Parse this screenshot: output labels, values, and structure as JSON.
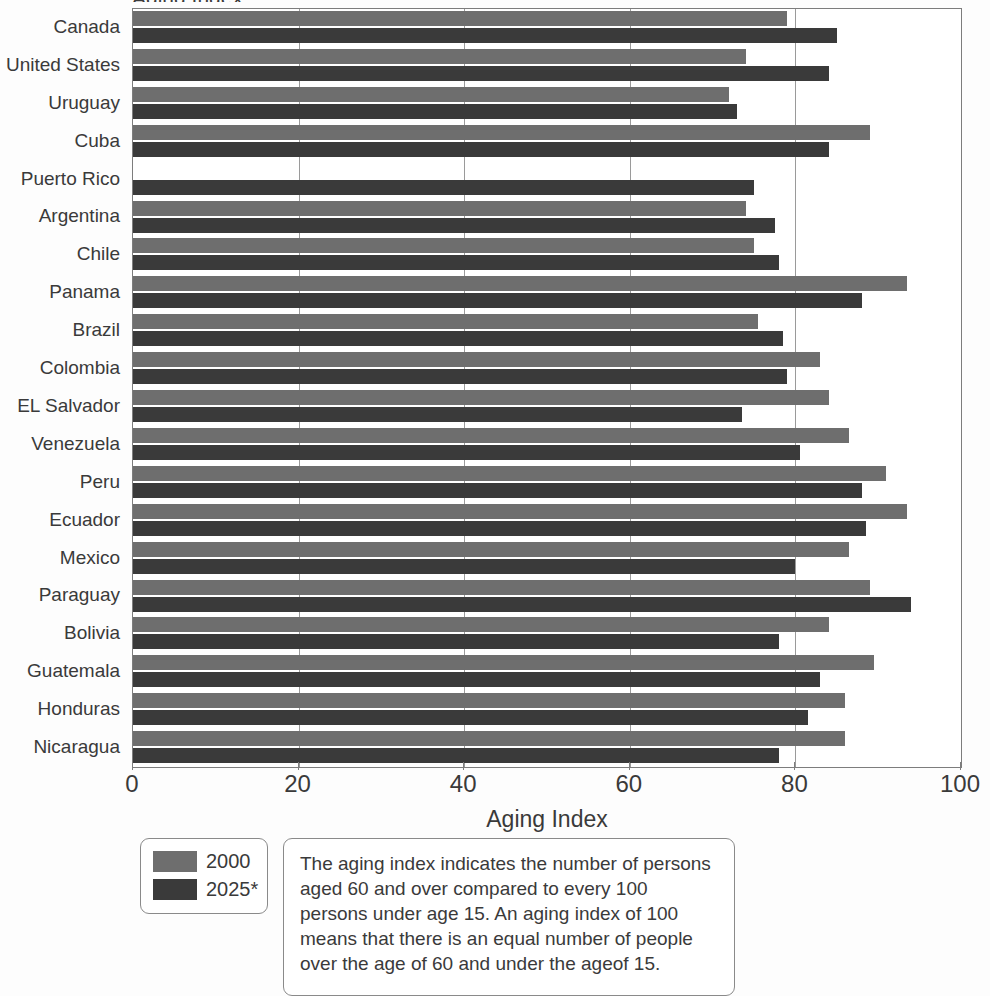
{
  "figure": {
    "cut_off_title": "Aging Index",
    "axis_title": "Aging Index"
  },
  "legend": {
    "position": "below-left",
    "items": [
      {
        "label": "2000",
        "color": "#6e6e6e"
      },
      {
        "label": "2025*",
        "color": "#3a3a3a"
      }
    ]
  },
  "note": {
    "text": "The aging index indicates the number of persons aged 60 and over compared to every 100 persons under age 15. An aging index of 100 means that there is an equal number of people over the age of 60 and under the ageof 15."
  },
  "chart_data": {
    "type": "bar",
    "orientation": "horizontal",
    "title": "Aging Index",
    "xlabel": "Aging Index",
    "ylabel": "",
    "xlim": [
      0,
      100
    ],
    "xticks": [
      0,
      20,
      40,
      60,
      80,
      100
    ],
    "grid": true,
    "grid_axis": "x",
    "legend_position": "bottom-left",
    "categories": [
      "Canada",
      "United States",
      "Uruguay",
      "Cuba",
      "Puerto Rico",
      "Argentina",
      "Chile",
      "Panama",
      "Brazil",
      "Colombia",
      "EL Salvador",
      "Venezuela",
      "Peru",
      "Ecuador",
      "Mexico",
      "Paraguay",
      "Bolivia",
      "Guatemala",
      "Honduras",
      "Nicaragua"
    ],
    "series": [
      {
        "name": "2000",
        "color": "#6e6e6e",
        "values": [
          79,
          74,
          72,
          89,
          0,
          74,
          75,
          93.5,
          75.5,
          83,
          84,
          86.5,
          91,
          93.5,
          86.5,
          89,
          84,
          89.5,
          86,
          86
        ]
      },
      {
        "name": "2025*",
        "color": "#3a3a3a",
        "values": [
          85,
          84,
          73,
          84,
          75,
          77.5,
          78,
          88,
          78.5,
          79,
          73.5,
          80.5,
          88,
          88.5,
          80,
          94,
          78,
          83,
          81.5,
          78
        ]
      }
    ]
  }
}
